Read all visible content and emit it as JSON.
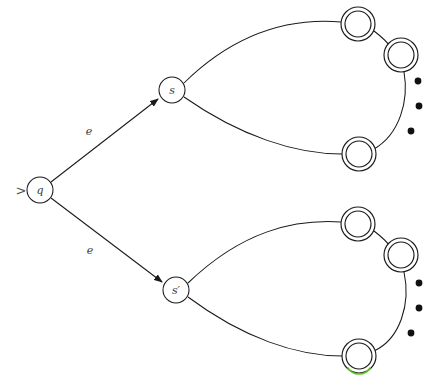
{
  "figure": {
    "background_color": "#ffffff",
    "stroke_color": "#1a1a1a",
    "highlight_color": "#5cc21e",
    "width": 435,
    "height": 379
  },
  "start_marker": {
    "glyph": ">",
    "x": 21,
    "y": 190
  },
  "nodes": [
    {
      "id": "q",
      "label": "q",
      "type": "start-state",
      "x": 40,
      "y": 190,
      "r": 13
    },
    {
      "id": "s",
      "label": "s",
      "type": "state",
      "x": 172,
      "y": 90,
      "r": 13
    },
    {
      "id": "sprime",
      "label": "s′",
      "type": "state",
      "x": 176,
      "y": 290,
      "r": 13
    }
  ],
  "accepting_states": [
    {
      "id": "acc-top-1",
      "group": "upper",
      "x": 358,
      "y": 24,
      "r_outer": 17,
      "r_inner": 13,
      "highlight": false
    },
    {
      "id": "acc-top-2",
      "group": "upper",
      "x": 401,
      "y": 55,
      "r_outer": 17,
      "r_inner": 13,
      "highlight": false
    },
    {
      "id": "acc-top-3",
      "group": "upper",
      "x": 359,
      "y": 154,
      "r_outer": 17,
      "r_inner": 13,
      "highlight": false
    },
    {
      "id": "acc-bottom-1",
      "group": "lower",
      "x": 358,
      "y": 224,
      "r_outer": 17,
      "r_inner": 13,
      "highlight": false
    },
    {
      "id": "acc-bottom-2",
      "group": "lower",
      "x": 401,
      "y": 255,
      "r_outer": 17,
      "r_inner": 13,
      "highlight": false
    },
    {
      "id": "acc-bottom-3",
      "group": "lower",
      "x": 359,
      "y": 356,
      "r_outer": 17,
      "r_inner": 13,
      "highlight": true
    }
  ],
  "edges": [
    {
      "id": "edge-q-s",
      "from": "q",
      "to": "s",
      "label": "e",
      "label_x": 89,
      "label_y": 131,
      "arrowhead": true,
      "path": "M 51 182 L 158 99"
    },
    {
      "id": "edge-q-sprime",
      "from": "q",
      "to": "sprime",
      "label": "e",
      "label_x": 90,
      "label_y": 250,
      "arrowhead": true,
      "path": "M 51 198 L 162 282"
    },
    {
      "id": "edge-s-acc-top-1",
      "from": "s",
      "to": "acc-top-1",
      "label": "",
      "arrowhead": false,
      "path": "M 184 83 C 238 30 292 18 341 22"
    },
    {
      "id": "edge-s-acc-top-3",
      "from": "s",
      "to": "acc-top-3",
      "label": "",
      "arrowhead": false,
      "path": "M 184 97 C 240 136 295 154 342 154"
    },
    {
      "id": "edge-arc-top",
      "from": "acc-top-1",
      "to": "acc-top-2",
      "label": "",
      "arrowhead": false,
      "path": "M 374 31 C 382 37 389 44 393 50"
    },
    {
      "id": "edge-arc-top-right",
      "from": "acc-top-2",
      "to": "acc-top-3",
      "label": "",
      "arrowhead": false,
      "path": "M 404 72 C 409 100 400 134 374 149"
    },
    {
      "id": "edge-sprime-acc-bottom-1",
      "from": "sprime",
      "to": "acc-bottom-1",
      "label": "",
      "arrowhead": false,
      "path": "M 188 283 C 242 231 294 219 341 222"
    },
    {
      "id": "edge-sprime-acc-bottom-3",
      "from": "sprime",
      "to": "acc-bottom-3",
      "label": "",
      "arrowhead": false,
      "path": "M 188 297 C 243 338 297 356 342 356"
    },
    {
      "id": "edge-arc-bottom",
      "from": "acc-bottom-1",
      "to": "acc-bottom-2",
      "label": "",
      "arrowhead": false,
      "path": "M 374 231 C 382 237 389 244 393 250"
    },
    {
      "id": "edge-arc-bottom-right",
      "from": "acc-bottom-2",
      "to": "acc-bottom-3",
      "label": "",
      "arrowhead": false,
      "path": "M 404 272 C 411 304 400 339 374 351"
    }
  ],
  "ellipsis_groups": [
    {
      "id": "ellipsis-upper",
      "dots": [
        {
          "x": 418,
          "y": 81,
          "r": 3.4
        },
        {
          "x": 419,
          "y": 106,
          "r": 3.4
        },
        {
          "x": 411,
          "y": 131,
          "r": 3.4
        }
      ]
    },
    {
      "id": "ellipsis-lower",
      "dots": [
        {
          "x": 419,
          "y": 283,
          "r": 3.4
        },
        {
          "x": 419,
          "y": 308,
          "r": 3.4
        },
        {
          "x": 411,
          "y": 333,
          "r": 3.4
        }
      ]
    }
  ],
  "labels": {
    "q": "q",
    "s": "s",
    "s_prime": "s′",
    "edge_upper": "e",
    "edge_lower": "e",
    "start_glyph": ">"
  }
}
